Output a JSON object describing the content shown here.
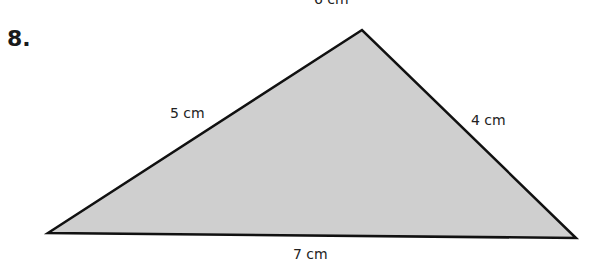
{
  "problem": {
    "number": "8."
  },
  "figure": {
    "shape": "triangle",
    "fill_color": "#cfcfcf",
    "stroke_color": "#111111",
    "vertices": {
      "apex": [
        362,
        30
      ],
      "left": [
        48,
        233
      ],
      "right": [
        576,
        238
      ]
    },
    "labels": {
      "top_cut_off": "6 cm",
      "left_side": "5 cm",
      "right_side": "4 cm",
      "base": "7 cm"
    }
  }
}
